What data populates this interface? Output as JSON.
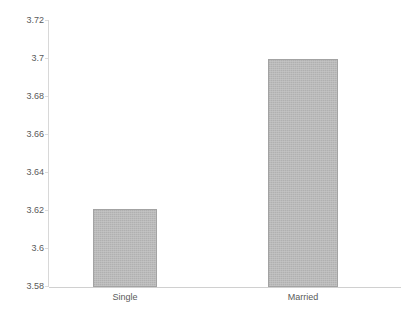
{
  "chart_data": {
    "type": "bar",
    "title": "",
    "subtitle": "",
    "xlabel": "",
    "ylabel": "",
    "categories": [
      "Single",
      "Married"
    ],
    "values": [
      3.621,
      3.6995
    ],
    "series": [
      {
        "name": "",
        "values": [
          3.621,
          3.6995
        ]
      }
    ],
    "ylim": [
      3.58,
      3.72
    ],
    "ytick_labels": [
      "3.72",
      "3.7",
      "3.68",
      "3.66",
      "3.64",
      "3.62",
      "3.6",
      "3.58"
    ],
    "ytick_values": [
      3.72,
      3.7,
      3.68,
      3.66,
      3.64,
      3.62,
      3.6,
      3.58
    ],
    "grid": false,
    "legend": false,
    "legend_position": "none",
    "bar_color": "#b4b4b4",
    "bar_border_color": "#a3a3a3",
    "axis_color": "#d8d8d8",
    "text_color": "#5a5a5a",
    "background": "#ffffff"
  }
}
